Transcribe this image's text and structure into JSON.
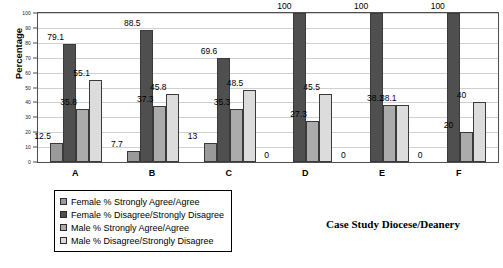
{
  "chart_data": {
    "type": "bar",
    "title": "",
    "xlabel": "Case Study Diocese/Deanery",
    "ylabel": "Percentage",
    "ylim": [
      0,
      100
    ],
    "ytick_step": 10,
    "yticks": [
      0,
      10,
      20,
      30,
      40,
      50,
      60,
      70,
      80,
      90,
      100
    ],
    "grid": true,
    "legend_position": "bottom-left",
    "categories": [
      "A",
      "B",
      "C",
      "D",
      "E",
      "F"
    ],
    "series": [
      {
        "name": "Female % Strongly Agree/Agree",
        "color": "#9a9a9a",
        "values": [
          12.5,
          7.7,
          13,
          0,
          0,
          0
        ],
        "labels": [
          "12.5",
          "7.7",
          "13",
          "0",
          "0",
          "0"
        ]
      },
      {
        "name": "Female % Disagree/Strongly Disagree",
        "color": "#4f4f4f",
        "values": [
          79.1,
          88.5,
          69.6,
          100,
          100,
          100
        ],
        "labels": [
          "79.1",
          "88.5",
          "69.6",
          "100",
          "100",
          "100"
        ]
      },
      {
        "name": "Male % Strongly Agree/Agree",
        "color": "#ababab",
        "values": [
          35.8,
          37.3,
          35.3,
          27.3,
          38.1,
          20
        ],
        "labels": [
          "35.8",
          "37.3",
          "35.3",
          "27.3",
          "38.1",
          "20"
        ]
      },
      {
        "name": "Male % Disagree/Strongly Disagree",
        "color": "#dcdcdc",
        "values": [
          55.1,
          45.8,
          48.5,
          45.5,
          38.1,
          40
        ],
        "labels": [
          "55.1",
          "45.8",
          "48.5",
          "45.5",
          "38.1",
          "40"
        ]
      }
    ]
  }
}
